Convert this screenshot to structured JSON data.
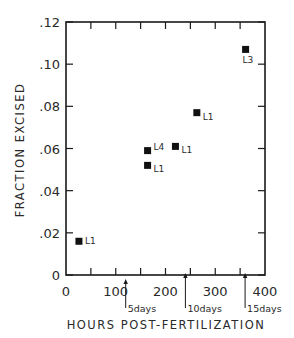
{
  "chart_data": {
    "type": "scatter",
    "title": "",
    "xlabel": "HOURS POST-FERTILIZATION",
    "ylabel": "FRACTION EXCISED",
    "xlim": [
      0,
      400
    ],
    "ylim": [
      0,
      0.12
    ],
    "x_ticks": [
      0,
      100,
      200,
      300,
      400
    ],
    "x_tick_labels": [
      "0",
      "100",
      "200",
      "300",
      "400"
    ],
    "x_minor_tick_step": 50,
    "y_ticks": [
      0,
      0.02,
      0.04,
      0.06,
      0.08,
      0.1,
      0.12
    ],
    "y_tick_labels": [
      "0",
      ".02",
      ".04",
      ".06",
      ".08",
      ".10",
      ".12"
    ],
    "grid": false,
    "legend": null,
    "marker": "filled-square",
    "points": [
      {
        "x": 26,
        "y": 0.016,
        "label": "L1"
      },
      {
        "x": 164,
        "y": 0.052,
        "label": "L1"
      },
      {
        "x": 164,
        "y": 0.059,
        "label": "L4"
      },
      {
        "x": 220,
        "y": 0.061,
        "label": "L1"
      },
      {
        "x": 263,
        "y": 0.077,
        "label": "L1"
      },
      {
        "x": 361,
        "y": 0.107,
        "label": "L3"
      }
    ],
    "annotations": [
      {
        "x": 120,
        "text": "5days",
        "type": "arrow-up"
      },
      {
        "x": 240,
        "text": "10days",
        "type": "arrow-up"
      },
      {
        "x": 360,
        "text": "15days",
        "type": "arrow-up"
      }
    ]
  }
}
